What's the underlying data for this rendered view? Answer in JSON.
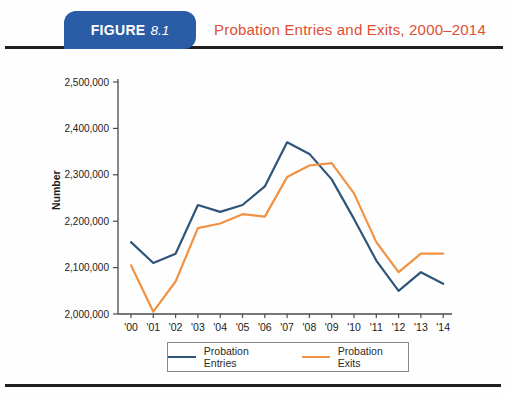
{
  "header": {
    "figure_label": "FIGURE",
    "figure_number": "8.1",
    "title": "Probation Entries and Exits, 2000–2014"
  },
  "colors": {
    "header_tab_bg": "#2b5ca6",
    "header_title_text": "#e04d33",
    "rule": "#1f1f1f",
    "axis": "#4a4a4a",
    "tick_label": "#1a1a1a",
    "entries_line": "#2f5578",
    "exits_line": "#f09243",
    "legend_border": "#8a8a8a"
  },
  "chart_data": {
    "type": "line",
    "title": "Probation Entries and Exits, 2000–2014",
    "xlabel": "",
    "ylabel": "Number",
    "ylim": [
      2000000,
      2500000
    ],
    "ytick_interval": 100000,
    "ytick_labels": [
      "2,000,000",
      "2,100,000",
      "2,200,000",
      "2,300,000",
      "2,400,000",
      "2,500,000"
    ],
    "categories": [
      "'00",
      "'01",
      "'02",
      "'03",
      "'04",
      "'05",
      "'06",
      "'07",
      "'08",
      "'09",
      "'10",
      "'11",
      "'12",
      "'13",
      "'14"
    ],
    "series": [
      {
        "name": "Probation Entries",
        "color_key": "entries_line",
        "values": [
          2155000,
          2110000,
          2130000,
          2235000,
          2220000,
          2235000,
          2275000,
          2370000,
          2345000,
          2290000,
          2205000,
          2115000,
          2050000,
          2090000,
          2065000
        ]
      },
      {
        "name": "Probation Exits",
        "color_key": "exits_line",
        "values": [
          2105000,
          2005000,
          2070000,
          2185000,
          2195000,
          2215000,
          2210000,
          2295000,
          2320000,
          2325000,
          2260000,
          2155000,
          2090000,
          2130000,
          2130000
        ]
      }
    ],
    "grid": false,
    "legend_position": "bottom"
  }
}
